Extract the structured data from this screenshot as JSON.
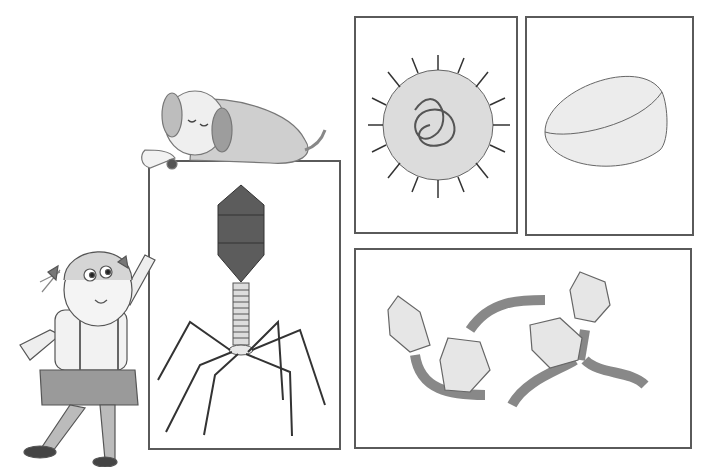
{
  "illustration": {
    "style": "pencil sketch, grayscale",
    "panels": [
      {
        "id": "phage-t4",
        "subject": "bacteriophage with dark icosahedral head, ringed tail and six legs"
      },
      {
        "id": "spiky-virus",
        "subject": "round virus covered in spikes with tangled genome"
      },
      {
        "id": "oval-capsule",
        "subject": "smooth oval pill-shaped particle"
      },
      {
        "id": "twisted-phages",
        "subject": "two phages with geodesic heads and twisted rope tails"
      }
    ],
    "characters": [
      {
        "id": "girl",
        "subject": "girl with pigtails and ruffled skirt leaning on box"
      },
      {
        "id": "dog",
        "subject": "sleeping floppy-eared dog lying on top of box"
      }
    ]
  },
  "colors": {
    "line": "#4a4a4a",
    "frame": "#5a5a5a",
    "phage_head": "#5c5c5c",
    "shade": "#cfcfcf",
    "light": "#e6e6e6"
  }
}
